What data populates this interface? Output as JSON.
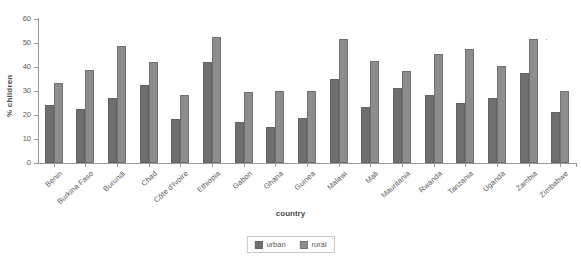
{
  "chart_data": {
    "type": "bar",
    "title": "",
    "xlabel": "country",
    "ylabel": "% children",
    "ylim": [
      0,
      60
    ],
    "yticks": [
      0,
      10,
      20,
      30,
      40,
      50,
      60
    ],
    "grid": false,
    "legend_position": "bottom-center",
    "categories": [
      "Benin",
      "Burkina Faso",
      "Burundi",
      "Chad",
      "Côte d'Ivoire",
      "Ethiopia",
      "Gabon",
      "Ghana",
      "Guinea",
      "Malawi",
      "Mali",
      "Mauritania",
      "Rwanda",
      "Tanzania",
      "Uganda",
      "Zambia",
      "Zimbabwe"
    ],
    "series": [
      {
        "name": "urban",
        "color": "#6f6f6f",
        "values": [
          24.0,
          22.7,
          27.2,
          32.3,
          18.5,
          42.0,
          17.2,
          15.2,
          18.6,
          34.8,
          23.4,
          31.2,
          28.3,
          25.0,
          27.0,
          37.5,
          21.2
        ]
      },
      {
        "name": "rural",
        "color": "#8d8d8d",
        "values": [
          33.5,
          38.8,
          48.8,
          42.2,
          28.5,
          52.5,
          29.5,
          30.0,
          30.0,
          51.5,
          42.5,
          38.3,
          45.6,
          47.3,
          40.3,
          51.5,
          30.0
        ]
      }
    ]
  },
  "legend": {
    "entries": [
      {
        "label": "urban",
        "swatch": "urban-swatch"
      },
      {
        "label": "rural",
        "swatch": "rural-swatch"
      }
    ]
  },
  "colors": {
    "urban": "#6f6f6f",
    "rural": "#8d8d8d",
    "axis": "#9a9a9a",
    "text": "#555555",
    "background": "#ffffff"
  }
}
